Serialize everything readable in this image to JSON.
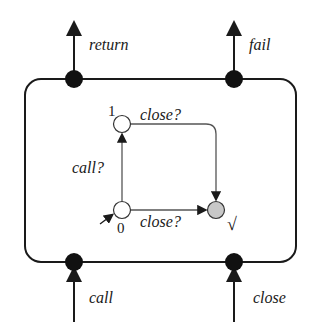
{
  "diagram": {
    "ports": {
      "top_left": "return",
      "top_right": "fail",
      "bottom_left": "call",
      "bottom_right": "close"
    },
    "automaton": {
      "states": [
        {
          "id": "0",
          "label": "0",
          "initial": true
        },
        {
          "id": "1",
          "label": "1"
        },
        {
          "id": "final",
          "label": "√",
          "accepting": true
        }
      ],
      "transitions": [
        {
          "from": "0",
          "to": "1",
          "label": "call?"
        },
        {
          "from": "1",
          "to": "final",
          "label": "close?"
        },
        {
          "from": "0",
          "to": "final",
          "label": "close?"
        }
      ]
    },
    "colors": {
      "line": "#1a1a1a",
      "inner_line": "#555555",
      "final_fill": "#c8c8c8"
    }
  }
}
